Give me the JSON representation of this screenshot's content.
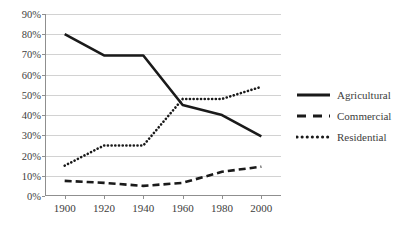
{
  "chart_data": {
    "type": "line",
    "title": "",
    "xlabel": "",
    "ylabel": "",
    "x": [
      1900,
      1920,
      1940,
      1960,
      1980,
      2000
    ],
    "categories": [
      "1900",
      "1920",
      "1940",
      "1960",
      "1980",
      "2000"
    ],
    "xlim": [
      1890,
      2010
    ],
    "ylim": [
      0,
      90
    ],
    "grid": "horizontal",
    "legend_position": "right",
    "y_ticks": [
      0,
      10,
      20,
      30,
      40,
      50,
      60,
      70,
      80,
      90
    ],
    "y_tick_labels": [
      "0%",
      "10%",
      "20%",
      "30%",
      "40%",
      "50%",
      "60%",
      "70%",
      "80%",
      "90%"
    ],
    "series": [
      {
        "name": "Agricultural",
        "style": "solid",
        "color": "#1a1a1a",
        "values": [
          80,
          69.5,
          69.5,
          45,
          40,
          29.5
        ]
      },
      {
        "name": "Commercial",
        "style": "dashed",
        "color": "#1a1a1a",
        "values": [
          7.5,
          6.5,
          5,
          6.5,
          12,
          14.5
        ]
      },
      {
        "name": "Residential",
        "style": "dotted",
        "color": "#1a1a1a",
        "values": [
          15,
          25,
          25,
          48,
          48,
          54
        ]
      }
    ]
  },
  "legend": {
    "items": [
      {
        "label": "Agricultural",
        "style": "solid"
      },
      {
        "label": "Commercial",
        "style": "dashed"
      },
      {
        "label": "Residential",
        "style": "dotted"
      }
    ]
  },
  "colors": {
    "ink": "#1a1a1a",
    "axis": "#8f8f8f",
    "grid": "#d2d2d2",
    "background": "#ffffff",
    "text": "#3d3d3d"
  }
}
